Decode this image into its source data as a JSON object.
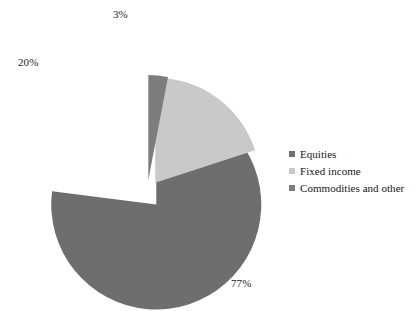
{
  "chart_data": {
    "type": "pie",
    "title": "",
    "subtitle": "",
    "xlabel": "",
    "ylabel": "",
    "grid": false,
    "legend_position": "right",
    "exploded": true,
    "unit": "%",
    "categories": [
      "Equities",
      "Fixed income",
      "Commodities and other"
    ],
    "values": [
      77,
      20,
      3
    ],
    "colors": [
      "#6e6e6e",
      "#c9c9c9",
      "#7d7d7d"
    ],
    "slices": [
      {
        "label": "Equities",
        "value": 77,
        "value_label": "77%",
        "color": "#6e6e6e",
        "exploded": true
      },
      {
        "label": "Fixed income",
        "value": 20,
        "value_label": "20%",
        "color": "#c9c9c9",
        "exploded": true
      },
      {
        "label": "Commodities and other",
        "value": 3,
        "value_label": "3%",
        "color": "#7d7d7d",
        "exploded": true
      }
    ],
    "data_labels": [
      "77%",
      "20%",
      "3%"
    ]
  },
  "legend": {
    "items": [
      {
        "label": "Equities",
        "color": "#6e6e6e"
      },
      {
        "label": "Fixed income",
        "color": "#c9c9c9"
      },
      {
        "label": "Commodities and other",
        "color": "#7d7d7d"
      }
    ]
  },
  "labels": {
    "equities": "77%",
    "fixed_income": "20%",
    "commodities": "3%"
  },
  "style": {
    "background": "#ffffff",
    "text_color": "#1a1a1a"
  }
}
